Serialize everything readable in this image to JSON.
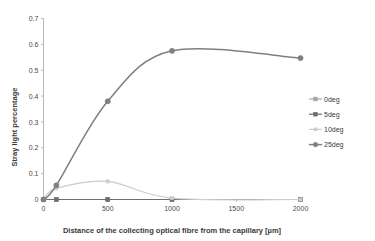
{
  "chart_data": {
    "type": "line",
    "title": "",
    "xlabel": "Distance of the collecting optical fibre from the capillary [µm]",
    "ylabel": "Stray light percentage",
    "xlim": [
      0,
      2000
    ],
    "ylim": [
      0,
      0.7
    ],
    "xticks": [
      "0",
      "500",
      "1000",
      "1500",
      "2000"
    ],
    "xtick_values": [
      0,
      500,
      1000,
      1500,
      2000
    ],
    "yticks": [
      "0",
      "0.1",
      "0.2",
      "0.3",
      "0.4",
      "0.5",
      "0.6",
      "0.7"
    ],
    "ytick_values": [
      0,
      0.1,
      0.2,
      0.3,
      0.4,
      0.5,
      0.6,
      0.7
    ],
    "grid": false,
    "legend_position": "right",
    "x": [
      0,
      100,
      500,
      1000,
      2000
    ],
    "series": [
      {
        "name": "0deg",
        "color": "#a6a6a6",
        "marker": "square",
        "smooth": true,
        "values": [
          0.0,
          0.0,
          0.0,
          0.0,
          0.0
        ]
      },
      {
        "name": "5deg",
        "color": "#6e6e6e",
        "marker": "square",
        "smooth": true,
        "values": [
          0.0,
          0.0,
          0.0,
          0.0,
          0.0
        ]
      },
      {
        "name": "10deg",
        "color": "#cccccc",
        "marker": "square",
        "smooth": true,
        "values": [
          0.0,
          0.043,
          0.07,
          0.005,
          0.0
        ]
      },
      {
        "name": "25deg",
        "color": "#808080",
        "marker": "circle",
        "smooth": true,
        "values": [
          0.0,
          0.055,
          0.38,
          0.575,
          0.547
        ]
      }
    ]
  },
  "legend": {
    "items": [
      {
        "label": "0deg"
      },
      {
        "label": "5deg"
      },
      {
        "label": "10deg"
      },
      {
        "label": "25deg"
      }
    ]
  }
}
